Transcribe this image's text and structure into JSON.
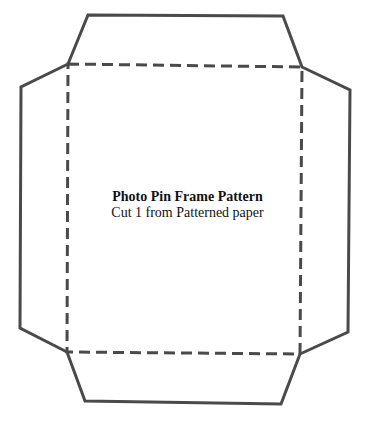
{
  "pattern": {
    "title": "Photo Pin Frame Pattern",
    "subtitle": "Cut 1 from Patterned paper",
    "line_color": "#4a4a4a"
  }
}
